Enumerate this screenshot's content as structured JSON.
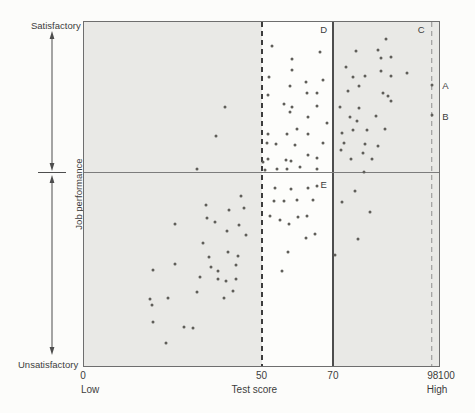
{
  "figure_title": "Scatter diagram of job performance versus test score with selection cutoffs",
  "colors": {
    "page_bg": "#fcfcfa",
    "band_gray": "#e9e9e6",
    "plot_bg": "#fdfdfb",
    "frame": "#6e6e6e",
    "cutoff_dashed_dark": "#3d3d3d",
    "cutoff_solid": "#4d4d4d",
    "cutoff_dashed_light": "#8f8f8f",
    "divide_line": "#7c7c7c",
    "point": "#5f5e59",
    "text": "#3c3c3c",
    "arrow": "#4d4d4d"
  },
  "y_axis": {
    "top_label": "Satisfactory",
    "bottom_label": "Unsatisfactory",
    "title": "Job performance"
  },
  "x_axis": {
    "title": "Test score",
    "left_caption": "Low",
    "right_caption": "High"
  },
  "chart_data": {
    "type": "scatter",
    "title": "",
    "xlabel": "Test score",
    "ylabel": "Job performance",
    "xlim": [
      0,
      100
    ],
    "ylim": [
      0,
      100
    ],
    "grid": false,
    "legend": false,
    "performance_cutoff": 56.4,
    "score_cutoffs": [
      {
        "value": 50,
        "style": "dashed_dark"
      },
      {
        "value": 70,
        "style": "solid"
      },
      {
        "value": 98,
        "style": "dashed_light"
      }
    ],
    "shaded_regions": [
      {
        "from": 0,
        "to": 50
      },
      {
        "from": 70,
        "to": 100
      }
    ],
    "x_ticks": [
      {
        "value": 0,
        "label": "0"
      },
      {
        "value": 50,
        "label": "50"
      },
      {
        "value": 70,
        "label": "70"
      },
      {
        "value": 98,
        "label": "98"
      },
      {
        "value": 100,
        "label": "100",
        "render_x": 101.8
      }
    ],
    "x_captions": [
      {
        "x": 2,
        "text": "Low"
      },
      {
        "x": 48,
        "text": "Test score"
      },
      {
        "x": 99.2,
        "text": "High"
      }
    ],
    "annotations": [
      {
        "text": "D",
        "x": 67.5,
        "y": 97.8
      },
      {
        "text": "C",
        "x": 95.0,
        "y": 97.8
      },
      {
        "text": "E",
        "x": 67.5,
        "y": 52.6
      },
      {
        "text": "A",
        "x": 101.8,
        "y": 81.3
      },
      {
        "text": "B",
        "x": 101.8,
        "y": 72.3
      }
    ],
    "points": [
      [
        39.8,
        75.4
      ],
      [
        37.3,
        66.8
      ],
      [
        31.9,
        57.2
      ],
      [
        53.0,
        92.9
      ],
      [
        66.4,
        91.3
      ],
      [
        58.5,
        89.2
      ],
      [
        58.7,
        86.0
      ],
      [
        52.1,
        84.1
      ],
      [
        58.0,
        81.5
      ],
      [
        62.4,
        82.5
      ],
      [
        67.3,
        83.1
      ],
      [
        62.7,
        79.4
      ],
      [
        65.5,
        79.4
      ],
      [
        51.7,
        78.9
      ],
      [
        56.4,
        76.2
      ],
      [
        58.5,
        75.2
      ],
      [
        65.7,
        75.5
      ],
      [
        58.0,
        73.8
      ],
      [
        63.1,
        72.3
      ],
      [
        68.5,
        70.7
      ],
      [
        60.1,
        69.0
      ],
      [
        51.9,
        67.5
      ],
      [
        57.1,
        67.5
      ],
      [
        63.1,
        67.5
      ],
      [
        67.3,
        64.8
      ],
      [
        51.5,
        64.8
      ],
      [
        54.0,
        64.4
      ],
      [
        59.4,
        64.2
      ],
      [
        63.1,
        61.3
      ],
      [
        65.7,
        60.6
      ],
      [
        51.7,
        60.1
      ],
      [
        50.5,
        59.3
      ],
      [
        56.8,
        59.8
      ],
      [
        58.3,
        59.5
      ],
      [
        60.8,
        57.9
      ],
      [
        54.3,
        57.4
      ],
      [
        57.3,
        57.4
      ],
      [
        51.0,
        57.1
      ],
      [
        65.5,
        57.4
      ],
      [
        85.2,
        95.0
      ],
      [
        82.8,
        91.8
      ],
      [
        76.6,
        91.6
      ],
      [
        86.6,
        89.7
      ],
      [
        83.8,
        89.4
      ],
      [
        73.8,
        86.8
      ],
      [
        83.8,
        85.8
      ],
      [
        91.0,
        85.2
      ],
      [
        79.1,
        84.4
      ],
      [
        75.9,
        83.9
      ],
      [
        86.4,
        84.2
      ],
      [
        98.0,
        81.7
      ],
      [
        77.5,
        81.3
      ],
      [
        74.4,
        79.8
      ],
      [
        84.3,
        79.3
      ],
      [
        85.7,
        78.6
      ],
      [
        86.4,
        76.9
      ],
      [
        72.2,
        75.4
      ],
      [
        77.5,
        74.9
      ],
      [
        98.0,
        73.0
      ],
      [
        75.0,
        72.3
      ],
      [
        76.8,
        71.1
      ],
      [
        82.2,
        72.8
      ],
      [
        79.8,
        68.5
      ],
      [
        84.7,
        69.0
      ],
      [
        72.8,
        67.8
      ],
      [
        75.9,
        68.7
      ],
      [
        73.3,
        64.7
      ],
      [
        79.1,
        64.4
      ],
      [
        82.8,
        63.9
      ],
      [
        72.5,
        62.9
      ],
      [
        78.7,
        62.0
      ],
      [
        81.2,
        60.3
      ],
      [
        75.2,
        60.3
      ],
      [
        78.9,
        56.4
      ],
      [
        44.3,
        49.3
      ],
      [
        34.5,
        46.7
      ],
      [
        40.8,
        45.3
      ],
      [
        45.0,
        46.0
      ],
      [
        34.7,
        43.1
      ],
      [
        36.9,
        41.8
      ],
      [
        25.6,
        41.4
      ],
      [
        43.6,
        41.0
      ],
      [
        40.3,
        39.2
      ],
      [
        45.7,
        38.1
      ],
      [
        33.5,
        35.8
      ],
      [
        40.6,
        33.2
      ],
      [
        35.2,
        31.7
      ],
      [
        43.4,
        32.0
      ],
      [
        25.6,
        29.6
      ],
      [
        35.9,
        28.9
      ],
      [
        42.7,
        29.3
      ],
      [
        19.5,
        27.9
      ],
      [
        37.8,
        27.5
      ],
      [
        37.8,
        25.4
      ],
      [
        32.6,
        25.9
      ],
      [
        40.1,
        24.8
      ],
      [
        42.9,
        25.4
      ],
      [
        31.9,
        21.6
      ],
      [
        41.9,
        21.9
      ],
      [
        39.4,
        19.9
      ],
      [
        18.6,
        19.5
      ],
      [
        23.8,
        19.9
      ],
      [
        19.1,
        17.7
      ],
      [
        19.5,
        12.9
      ],
      [
        28.2,
        11.3
      ],
      [
        30.8,
        11.1
      ],
      [
        23.1,
        6.6
      ],
      [
        53.8,
        51.7
      ],
      [
        58.3,
        51.5
      ],
      [
        63.1,
        51.7
      ],
      [
        65.7,
        52.2
      ],
      [
        53.5,
        47.9
      ],
      [
        56.4,
        48.1
      ],
      [
        59.9,
        48.4
      ],
      [
        64.5,
        48.2
      ],
      [
        52.4,
        43.7
      ],
      [
        55.2,
        42.3
      ],
      [
        57.8,
        41.4
      ],
      [
        60.3,
        43.3
      ],
      [
        62.7,
        43.6
      ],
      [
        62.4,
        37.3
      ],
      [
        65.0,
        38.4
      ],
      [
        57.5,
        33.2
      ],
      [
        55.8,
        27.7
      ],
      [
        76.4,
        50.8
      ],
      [
        72.8,
        47.6
      ],
      [
        80.6,
        44.7
      ],
      [
        77.3,
        37.0
      ],
      [
        70.7,
        32.3
      ]
    ]
  }
}
